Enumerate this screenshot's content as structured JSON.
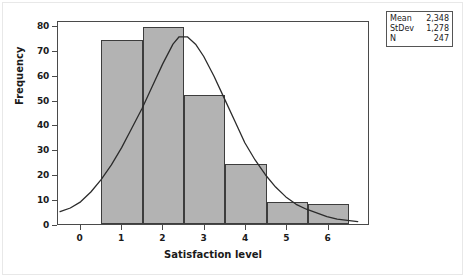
{
  "chart_data": {
    "type": "bar",
    "title": "",
    "subtitle": "",
    "xlabel": "Satisfaction level",
    "ylabel": "Frequency",
    "xlim": [
      -0.55,
      7.0
    ],
    "ylim": [
      0,
      82
    ],
    "grid": false,
    "bin_width": 1,
    "categories": [
      "1",
      "2",
      "3",
      "4",
      "5",
      "6"
    ],
    "bin_edges": [
      0.5,
      1.5,
      2.5,
      3.5,
      4.5,
      5.5,
      6.5
    ],
    "values": [
      74,
      79,
      52,
      24,
      9,
      8
    ],
    "series": [
      {
        "name": "Frequency",
        "values": [
          74,
          79,
          52,
          24,
          9,
          8
        ]
      },
      {
        "name": "Normal fit curve",
        "type": "line",
        "peak_x": 2.35,
        "peak_y": 76,
        "points": [
          [
            -0.5,
            5
          ],
          [
            -0.25,
            6.5
          ],
          [
            0.0,
            9
          ],
          [
            0.25,
            13
          ],
          [
            0.5,
            18
          ],
          [
            0.75,
            24
          ],
          [
            1.0,
            31
          ],
          [
            1.25,
            39
          ],
          [
            1.5,
            47
          ],
          [
            1.75,
            56
          ],
          [
            2.0,
            65
          ],
          [
            2.25,
            73
          ],
          [
            2.4,
            76
          ],
          [
            2.6,
            76
          ],
          [
            2.8,
            73
          ],
          [
            3.0,
            68
          ],
          [
            3.25,
            60
          ],
          [
            3.5,
            51
          ],
          [
            3.75,
            42
          ],
          [
            4.0,
            33
          ],
          [
            4.25,
            26
          ],
          [
            4.5,
            20
          ],
          [
            4.75,
            15
          ],
          [
            5.0,
            11
          ],
          [
            5.25,
            8
          ],
          [
            5.5,
            6
          ],
          [
            5.75,
            4.5
          ],
          [
            6.0,
            3
          ],
          [
            6.25,
            2
          ],
          [
            6.5,
            1.5
          ],
          [
            6.75,
            1
          ]
        ]
      }
    ],
    "yticks": [
      0,
      10,
      20,
      30,
      40,
      50,
      60,
      70,
      80
    ],
    "ytick_labels": [
      "0",
      "10",
      "20",
      "30",
      "40",
      "50",
      "60",
      "70",
      "80"
    ],
    "xticks": [
      0,
      1,
      2,
      3,
      4,
      5,
      6
    ],
    "xtick_labels": [
      "0",
      "1",
      "2",
      "3",
      "4",
      "5",
      "6"
    ],
    "legend_position": "top-right",
    "bar_fill_color": "#b3b3b3",
    "bar_edge_color": "#3d3d3d",
    "curve_color": "#2b2b2b",
    "axis_color": "#4a4a4a",
    "background_color": "#ffffff"
  },
  "stats_box": {
    "rows": [
      {
        "key": "Mean",
        "value": "2,348"
      },
      {
        "key": "StDev",
        "value": "1,278"
      },
      {
        "key": "N",
        "value": "247"
      }
    ]
  }
}
